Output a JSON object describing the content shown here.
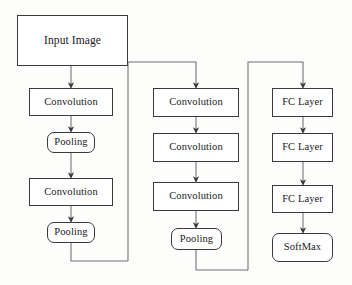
{
  "diagram": {
    "style": {
      "box_border_color": "#3a3a3a",
      "box_fill_color": "#ffffff",
      "wire_color": "#6f6f6f",
      "text_color": "#20201f",
      "background_color": "#fdfdfc"
    },
    "nodes": [
      {
        "id": "input-image",
        "label": "Input Image",
        "shape": "rect",
        "x": 17,
        "y": 15,
        "w": 111,
        "h": 51,
        "font_size": 11.5
      },
      {
        "id": "conv-1",
        "label": "Convolution",
        "shape": "rect",
        "x": 29,
        "y": 88,
        "w": 84,
        "h": 28,
        "font_size": 10.5
      },
      {
        "id": "pool-1",
        "label": "Pooling",
        "shape": "rounded",
        "x": 47,
        "y": 132,
        "w": 48,
        "h": 21,
        "font_size": 10.5
      },
      {
        "id": "conv-2",
        "label": "Convolution",
        "shape": "rect",
        "x": 29,
        "y": 178,
        "w": 84,
        "h": 28,
        "font_size": 10.5
      },
      {
        "id": "pool-2",
        "label": "Pooling",
        "shape": "rounded",
        "x": 47,
        "y": 222,
        "w": 48,
        "h": 21,
        "font_size": 10.5
      },
      {
        "id": "conv-3",
        "label": "Convolution",
        "shape": "rect",
        "x": 153,
        "y": 88,
        "w": 86,
        "h": 29,
        "font_size": 10.5
      },
      {
        "id": "conv-4",
        "label": "Convolution",
        "shape": "rect",
        "x": 153,
        "y": 133,
        "w": 86,
        "h": 29,
        "font_size": 10.5
      },
      {
        "id": "conv-5",
        "label": "Convolution",
        "shape": "rect",
        "x": 153,
        "y": 182,
        "w": 86,
        "h": 29,
        "font_size": 10.5
      },
      {
        "id": "pool-3",
        "label": "Pooling",
        "shape": "rounded",
        "x": 171,
        "y": 228,
        "w": 51,
        "h": 22,
        "font_size": 10.5
      },
      {
        "id": "fc-1",
        "label": "FC Layer",
        "shape": "rect",
        "x": 272,
        "y": 88,
        "w": 61,
        "h": 29,
        "font_size": 10.5
      },
      {
        "id": "fc-2",
        "label": "FC Layer",
        "shape": "rect",
        "x": 272,
        "y": 133,
        "w": 61,
        "h": 29,
        "font_size": 10.5
      },
      {
        "id": "fc-3",
        "label": "FC Layer",
        "shape": "rect",
        "x": 272,
        "y": 185,
        "w": 61,
        "h": 28,
        "font_size": 10.5
      },
      {
        "id": "softmax",
        "label": "SoftMax",
        "shape": "rounded",
        "x": 272,
        "y": 233,
        "w": 61,
        "h": 29,
        "font_size": 10.5
      }
    ],
    "edges": [
      {
        "id": "input-to-conv1",
        "from": "input-image",
        "to": "conv-1",
        "type": "vertical-arrow"
      },
      {
        "id": "conv1-to-pool1",
        "from": "conv-1",
        "to": "pool-1",
        "type": "vertical-arrow"
      },
      {
        "id": "pool1-to-conv2",
        "from": "pool-1",
        "to": "conv-2",
        "type": "vertical-arrow"
      },
      {
        "id": "conv2-to-pool2",
        "from": "conv-2",
        "to": "pool-2",
        "type": "vertical-arrow"
      },
      {
        "id": "pool2-to-conv3",
        "from": "pool-2",
        "to": "conv-3",
        "type": "elbow-arrow"
      },
      {
        "id": "conv3-to-conv4",
        "from": "conv-3",
        "to": "conv-4",
        "type": "vertical-arrow"
      },
      {
        "id": "conv4-to-conv5",
        "from": "conv-4",
        "to": "conv-5",
        "type": "vertical-arrow"
      },
      {
        "id": "conv5-to-pool3",
        "from": "conv-5",
        "to": "pool-3",
        "type": "vertical-arrow"
      },
      {
        "id": "pool3-to-fc1",
        "from": "pool-3",
        "to": "fc-1",
        "type": "elbow-arrow"
      },
      {
        "id": "fc1-to-fc2",
        "from": "fc-1",
        "to": "fc-2",
        "type": "vertical-arrow"
      },
      {
        "id": "fc2-to-fc3",
        "from": "fc-2",
        "to": "fc-3",
        "type": "vertical-arrow"
      },
      {
        "id": "fc3-to-softmax",
        "from": "fc-3",
        "to": "softmax",
        "type": "vertical-arrow"
      }
    ]
  }
}
